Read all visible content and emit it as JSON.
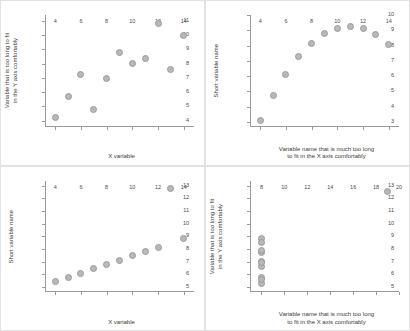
{
  "figure": {
    "layout": "2x2-grid",
    "marker_fill": "#b8b8b8",
    "marker_edge": "#9b9b9b",
    "axis_color": "#9a9a9a",
    "panel_border": "#e2e2e2",
    "background": "#ffffff"
  },
  "chart_data": [
    {
      "type": "scatter",
      "title": "",
      "panel": "top-left",
      "xlabel": "X variable",
      "ylabel": "Variable that is too long to fit\nin the Y axis comfortably",
      "ylabel_lines": [
        "Variable that is too long to fit",
        "in the Y axis comfortably"
      ],
      "xlabel_lines": [
        "X variable"
      ],
      "xlim": [
        3.2,
        14.8
      ],
      "ylim": [
        3.6,
        11.4
      ],
      "xticks": [
        4,
        6,
        8,
        10,
        12,
        14
      ],
      "yticks": [
        4,
        5,
        6,
        7,
        8,
        9,
        10,
        11
      ],
      "grid": false,
      "legend": "none",
      "x": [
        10,
        8,
        13,
        9,
        11,
        14,
        6,
        4,
        12,
        7,
        5
      ],
      "y": [
        8.04,
        6.95,
        7.58,
        8.81,
        8.33,
        9.96,
        7.24,
        4.26,
        10.84,
        4.82,
        5.68
      ]
    },
    {
      "type": "scatter",
      "title": "",
      "panel": "top-right",
      "xlabel": "Variable name that is much too long\nto fit in the X axis comfortably",
      "ylabel": "Short variable name",
      "ylabel_lines": [
        "Short variable name"
      ],
      "xlabel_lines": [
        "Variable name that is much too long",
        "to fit in the X axis comfortably"
      ],
      "xlim": [
        3.2,
        14.8
      ],
      "ylim": [
        2.7,
        10.0
      ],
      "xticks": [
        4,
        6,
        8,
        10,
        12,
        14
      ],
      "yticks": [
        3,
        4,
        5,
        6,
        7,
        8,
        9,
        10
      ],
      "grid": false,
      "legend": "none",
      "x": [
        10,
        8,
        13,
        9,
        11,
        14,
        6,
        4,
        12,
        7,
        5
      ],
      "y": [
        9.14,
        8.14,
        8.74,
        8.77,
        9.26,
        8.1,
        6.13,
        3.1,
        9.13,
        7.26,
        4.74
      ]
    },
    {
      "type": "scatter",
      "title": "",
      "panel": "bottom-left",
      "xlabel": "X variable",
      "ylabel": "Short variable name",
      "ylabel_lines": [
        "Short variable name"
      ],
      "xlabel_lines": [
        "X variable"
      ],
      "xlim": [
        3.2,
        14.8
      ],
      "ylim": [
        4.6,
        13.4
      ],
      "xticks": [
        4,
        6,
        8,
        10,
        12,
        14
      ],
      "yticks": [
        5,
        6,
        7,
        8,
        9,
        10,
        11,
        12,
        13
      ],
      "grid": false,
      "legend": "none",
      "x": [
        10,
        8,
        13,
        9,
        11,
        14,
        6,
        4,
        12,
        7,
        5
      ],
      "y": [
        7.46,
        6.77,
        12.74,
        7.11,
        7.81,
        8.84,
        6.08,
        5.39,
        8.15,
        6.42,
        5.73
      ]
    },
    {
      "type": "scatter",
      "title": "",
      "panel": "bottom-right",
      "xlabel": "Variable name that is much too long\nto fit in the X axis comfortably",
      "ylabel": "Variable that is too long to fit\nin the Y axis comfortably",
      "ylabel_lines": [
        "Variable that is too long to fit",
        "in the Y axis comfortably"
      ],
      "xlabel_lines": [
        "Variable name that is much too long",
        "to fit in the X axis comfortably"
      ],
      "xlim": [
        7.0,
        20.0
      ],
      "ylim": [
        4.6,
        13.4
      ],
      "xticks": [
        8,
        10,
        12,
        14,
        16,
        18,
        20
      ],
      "yticks": [
        5,
        6,
        7,
        8,
        9,
        10,
        11,
        12,
        13
      ],
      "grid": false,
      "legend": "none",
      "x": [
        8,
        8,
        8,
        8,
        8,
        8,
        8,
        19,
        8,
        8,
        8
      ],
      "y": [
        6.58,
        5.76,
        7.71,
        8.84,
        8.47,
        7.04,
        5.25,
        12.5,
        5.56,
        7.91,
        6.89
      ]
    }
  ]
}
